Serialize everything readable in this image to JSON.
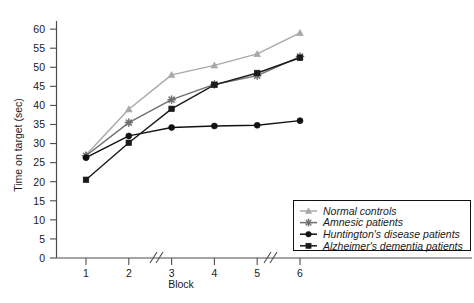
{
  "chart_data": {
    "type": "line",
    "title": "",
    "xlabel": "Block",
    "ylabel": "Time on target (sec)",
    "x": [
      1,
      2,
      3,
      4,
      5,
      6
    ],
    "xticklabels": [
      "1",
      "2",
      "3",
      "4",
      "5",
      "6"
    ],
    "yticks": [
      0,
      5,
      10,
      15,
      20,
      25,
      30,
      35,
      40,
      45,
      50,
      55,
      60
    ],
    "yticklabels": [
      "0",
      "5",
      "10",
      "15",
      "20",
      "25",
      "30",
      "35",
      "40",
      "45",
      "50",
      "55",
      "60"
    ],
    "ylim": [
      0,
      62
    ],
    "xlim": [
      0.55,
      6.45
    ],
    "grid": false,
    "axis_breaks": [
      "between 2 and 3",
      "between 4 and 5"
    ],
    "legend_position": "bottom-right",
    "series": [
      {
        "name": "Normal controls",
        "marker": "triangle",
        "color": "#a8a8a8",
        "values": [
          27.0,
          39.0,
          48.0,
          50.5,
          53.5,
          59.0
        ]
      },
      {
        "name": "Amnesic patients",
        "marker": "star",
        "color": "#6e6e6e",
        "values": [
          26.8,
          35.5,
          41.5,
          45.5,
          47.8,
          52.8
        ]
      },
      {
        "name": "Huntington's disease patients",
        "marker": "circle",
        "color": "#111111",
        "values": [
          26.3,
          32.0,
          34.2,
          34.6,
          34.8,
          36.0
        ]
      },
      {
        "name": "Alzheimer's dementia patients",
        "marker": "square",
        "color": "#1a1a1a",
        "values": [
          20.5,
          30.2,
          39.1,
          45.4,
          48.5,
          52.5
        ]
      }
    ]
  },
  "legend": {
    "entries": [
      {
        "label": "Normal controls"
      },
      {
        "label": "Amnesic patients"
      },
      {
        "label": "Huntington's disease patients"
      },
      {
        "label": "Alzheimer's dementia patients"
      }
    ]
  }
}
